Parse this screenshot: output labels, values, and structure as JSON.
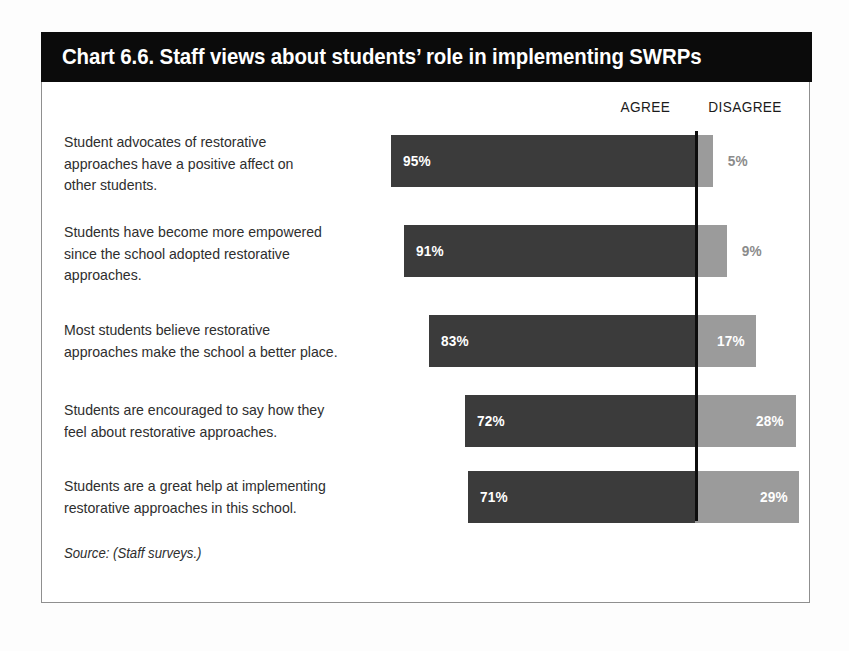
{
  "chart": {
    "title": "Chart 6.6. Staff views about students’ role in implementing SWRPs",
    "source_note": "Source: (Staff surveys.)",
    "headers": {
      "agree": "AGREE",
      "disagree": "DISAGREE"
    }
  },
  "chart_data": {
    "type": "bar",
    "subtype": "diverging-stacked-horizontal",
    "title": "Chart 6.6. Staff views about students’ role in implementing SWRPs",
    "xlabel": "",
    "ylabel": "",
    "source": "Source: (Staff surveys.)",
    "legend": [
      "AGREE",
      "DISAGREE"
    ],
    "legend_position": "top-right",
    "grid": false,
    "axis_line_at_percent": 100,
    "units": "percent",
    "categories": [
      "Student advocates of restorative approaches have a positive affect on other students.",
      "Students have become more empowered since the school adopted restorative approaches.",
      "Most students believe restorative approaches make the school a better place.",
      "Students are encouraged to say how they feel about restorative approaches.",
      "Students are a great help at implementing restorative approaches in this school."
    ],
    "series": [
      {
        "name": "AGREE",
        "values": [
          95,
          91,
          83,
          72,
          71
        ],
        "color": "#3b3b3b"
      },
      {
        "name": "DISAGREE",
        "values": [
          5,
          9,
          17,
          28,
          29
        ],
        "color": "#9b9b9b"
      }
    ],
    "rows": [
      {
        "label_lines": [
          "Student advocates of restorative",
          "approaches have a positive affect on",
          "other students."
        ],
        "agree": 95,
        "disagree": 5,
        "agree_label": "95%",
        "disagree_label": "5%",
        "disagree_label_placement": "outside"
      },
      {
        "label_lines": [
          "Students have become more empowered",
          "since the school adopted restorative",
          "approaches."
        ],
        "agree": 91,
        "disagree": 9,
        "agree_label": "91%",
        "disagree_label": "9%",
        "disagree_label_placement": "outside"
      },
      {
        "label_lines": [
          "Most students believe restorative",
          "approaches make the school a better place."
        ],
        "agree": 83,
        "disagree": 17,
        "agree_label": "83%",
        "disagree_label": "17%",
        "disagree_label_placement": "inside"
      },
      {
        "label_lines": [
          "Students are encouraged to say how they",
          "feel about restorative approaches."
        ],
        "agree": 72,
        "disagree": 28,
        "agree_label": "72%",
        "disagree_label": "28%",
        "disagree_label_placement": "inside"
      },
      {
        "label_lines": [
          "Students are a great help at implementing",
          "restorative approaches in this school."
        ],
        "agree": 71,
        "disagree": 29,
        "agree_label": "71%",
        "disagree_label": "29%",
        "disagree_label_placement": "inside"
      }
    ],
    "colors": {
      "agree": "#3b3b3b",
      "disagree": "#9b9b9b",
      "title_band": "#0b0b0b",
      "title_text": "#ffffff",
      "body_text": "#2e2e2e",
      "frame_border": "#8f8f8f",
      "axis_line": "#0d0d0d",
      "outside_label_text": "#8b8b8b"
    }
  },
  "layout": {
    "rows_geometry": [
      {
        "top": 14,
        "height": 52,
        "label_top": 10
      },
      {
        "top": 104,
        "height": 52,
        "label_top": 100
      },
      {
        "top": 194,
        "height": 52,
        "label_top": 198
      },
      {
        "top": 274,
        "height": 52,
        "label_top": 278
      },
      {
        "top": 350,
        "height": 52,
        "label_top": 354
      }
    ],
    "px_per_percent_agree": 3.2,
    "px_per_percent_disagree": 3.6,
    "boundary_x": 653
  }
}
